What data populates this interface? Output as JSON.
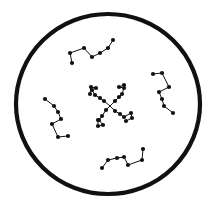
{
  "diagram": {
    "colors": {
      "stroke": "#111111",
      "background": "#ffffff"
    },
    "container": {
      "shape": "circle",
      "cx": 108,
      "cy": 104,
      "rx": 92,
      "ry": 90,
      "stroke_width": 4.2
    },
    "linear_chains": [
      {
        "name": "chain-top",
        "points": [
          [
            72,
            63
          ],
          [
            70,
            53
          ],
          [
            84,
            48
          ],
          [
            92,
            57
          ],
          [
            100,
            53
          ],
          [
            108,
            48
          ],
          [
            113,
            40
          ]
        ]
      },
      {
        "name": "chain-right",
        "points": [
          [
            153,
            74
          ],
          [
            162,
            73
          ],
          [
            169,
            87
          ],
          [
            159,
            92
          ],
          [
            162,
            99
          ],
          [
            164,
            106
          ],
          [
            173,
            113
          ]
        ]
      },
      {
        "name": "chain-left",
        "points": [
          [
            45,
            99
          ],
          [
            54,
            106
          ],
          [
            58,
            112
          ],
          [
            61,
            119
          ],
          [
            52,
            124
          ],
          [
            58,
            137
          ],
          [
            68,
            136
          ]
        ]
      },
      {
        "name": "chain-bottom",
        "points": [
          [
            102,
            168
          ],
          [
            108,
            160
          ],
          [
            117,
            158
          ],
          [
            124,
            157
          ],
          [
            128,
            165
          ],
          [
            142,
            160
          ],
          [
            143,
            149
          ]
        ]
      }
    ],
    "star_polymer": {
      "core": [
        110,
        106
      ],
      "arms": [
        {
          "name": "arm-upper-left",
          "points": [
            [
              110,
              106
            ],
            [
              104,
              101
            ],
            [
              100,
              98
            ],
            [
              95,
              95
            ],
            [
              92,
              90
            ],
            [
              96,
              88
            ],
            [
              91,
              87
            ],
            [
              90,
              94
            ]
          ]
        },
        {
          "name": "arm-upper-right",
          "points": [
            [
              110,
              106
            ],
            [
              115,
              101
            ],
            [
              119,
              97
            ],
            [
              122,
              94
            ],
            [
              124,
              88
            ],
            [
              119,
              87
            ],
            [
              124,
              85
            ]
          ]
        },
        {
          "name": "arm-lower-left",
          "points": [
            [
              110,
              106
            ],
            [
              106,
              110
            ],
            [
              102,
              116
            ],
            [
              99,
              120
            ],
            [
              103,
              125
            ],
            [
              98,
              126
            ],
            [
              98,
              120
            ]
          ]
        },
        {
          "name": "arm-lower-right",
          "points": [
            [
              110,
              106
            ],
            [
              115,
              111
            ],
            [
              120,
              114
            ],
            [
              124,
              117
            ],
            [
              131,
              113
            ],
            [
              132,
              118
            ],
            [
              126,
              121
            ]
          ]
        }
      ]
    },
    "bead_radius": 2.1,
    "line_width": 1.0
  }
}
